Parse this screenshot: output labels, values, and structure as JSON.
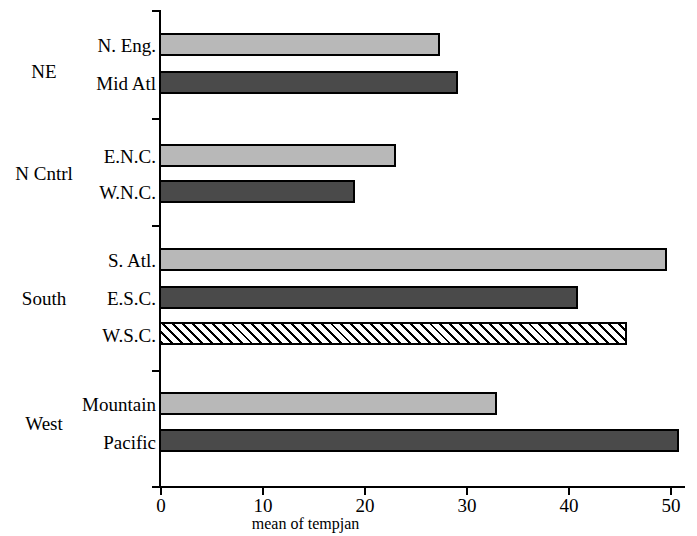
{
  "chart_data": {
    "type": "bar",
    "orientation": "horizontal",
    "title": "",
    "xlabel": "mean of tempjan",
    "ylabel": "",
    "xlim": [
      0,
      52.5
    ],
    "xticks": [
      0,
      10,
      20,
      30,
      40,
      50
    ],
    "xtick_labels": [
      "0",
      "10",
      "20",
      "30",
      "40",
      "50"
    ],
    "grid": false,
    "legend": "none",
    "categories": [
      "N. Eng.",
      "Mid Atl",
      "E.N.C.",
      "W.N.C.",
      "S. Atl.",
      "E.S.C.",
      "W.S.C.",
      "Mountain",
      "Pacific"
    ],
    "values": [
      27.3,
      29.1,
      23.0,
      19.0,
      49.5,
      40.8,
      45.6,
      32.9,
      50.7
    ],
    "bar_styles": [
      "light-gray",
      "dark-gray",
      "light-gray",
      "dark-gray",
      "light-gray",
      "dark-gray",
      "hatched",
      "light-gray",
      "dark-gray"
    ],
    "groups": [
      {
        "label": "NE",
        "categories": [
          "N. Eng.",
          "Mid Atl"
        ]
      },
      {
        "label": "N Cntrl",
        "categories": [
          "E.N.C.",
          "W.N.C."
        ]
      },
      {
        "label": "South",
        "categories": [
          "S. Atl.",
          "E.S.C.",
          "W.S.C."
        ]
      },
      {
        "label": "West",
        "categories": [
          "Mountain",
          "Pacific"
        ]
      }
    ],
    "colors": {
      "light_gray": "#b8b8b8",
      "dark_gray": "#4a4a4a",
      "hatch_background": "#ffffff",
      "hatch_line": "#000000",
      "outline": "#000000",
      "background": "#ffffff"
    }
  },
  "axis": {
    "x_title": "mean of tempjan",
    "tick_0": "0",
    "tick_1": "10",
    "tick_2": "20",
    "tick_3": "30",
    "tick_4": "40",
    "tick_5": "50"
  },
  "bars": [
    {
      "label": "N. Eng.",
      "value": 27.3,
      "style": "light-gray"
    },
    {
      "label": "Mid Atl",
      "value": 29.1,
      "style": "dark-gray"
    },
    {
      "label": "E.N.C.",
      "value": 23.0,
      "style": "light-gray"
    },
    {
      "label": "W.N.C.",
      "value": 19.0,
      "style": "dark-gray"
    },
    {
      "label": "S. Atl.",
      "value": 49.5,
      "style": "light-gray"
    },
    {
      "label": "E.S.C.",
      "value": 40.8,
      "style": "dark-gray"
    },
    {
      "label": "W.S.C.",
      "value": 45.6,
      "style": "hatched"
    },
    {
      "label": "Mountain",
      "value": 32.9,
      "style": "light-gray"
    },
    {
      "label": "Pacific",
      "value": 50.7,
      "style": "dark-gray"
    }
  ],
  "groups": [
    {
      "label": "NE"
    },
    {
      "label": "N Cntrl"
    },
    {
      "label": "South"
    },
    {
      "label": "West"
    }
  ]
}
